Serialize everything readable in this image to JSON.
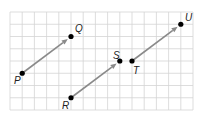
{
  "figure": {
    "grid": {
      "columns": 15,
      "rows": 8,
      "line_color": "#d4d4d4"
    },
    "colors": {
      "vector": "#8a8a8a",
      "point": "#000000",
      "label": "#222222"
    },
    "points": [
      {
        "id": "P",
        "label": "P",
        "col": 1,
        "row": 5
      },
      {
        "id": "Q",
        "label": "Q",
        "col": 5,
        "row": 2
      },
      {
        "id": "R",
        "label": "R",
        "col": 5,
        "row": 7
      },
      {
        "id": "S",
        "label": "S",
        "col": 9,
        "row": 4
      },
      {
        "id": "T",
        "label": "T",
        "col": 10,
        "row": 4
      },
      {
        "id": "U",
        "label": "U",
        "col": 14,
        "row": 1
      }
    ],
    "vectors": [
      {
        "from": "P",
        "to": "Q",
        "delta": [
          4,
          -3
        ]
      },
      {
        "from": "R",
        "to": "S",
        "delta": [
          4,
          -3
        ]
      },
      {
        "from": "T",
        "to": "U",
        "delta": [
          4,
          -3
        ]
      }
    ]
  }
}
